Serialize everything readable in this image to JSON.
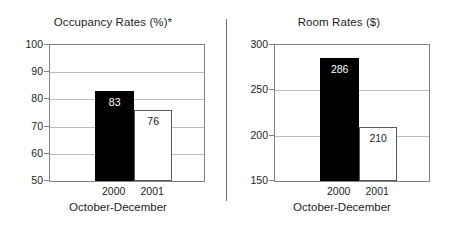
{
  "figure": {
    "divider": "vertical-rule",
    "panels": [
      "occupancy",
      "room_rates"
    ]
  },
  "chart_data": [
    {
      "type": "bar",
      "id": "occupancy",
      "title": "Occupancy Rates (%)*",
      "xlabel": "October-December",
      "ylabel": "",
      "categories": [
        "2000",
        "2001"
      ],
      "values": [
        83,
        76
      ],
      "value_labels": [
        "83",
        "76"
      ],
      "ylim": [
        50,
        100
      ],
      "yticks": [
        50,
        60,
        70,
        80,
        90,
        100
      ],
      "ytick_labels": [
        "50",
        "60",
        "70",
        "80",
        "90",
        "100"
      ],
      "grid": true,
      "legend": "none",
      "bar_styles": [
        "filled",
        "hollow"
      ],
      "colors": {
        "filled": "#000000",
        "hollow": "#ffffff",
        "outline": "#58595b",
        "grid": "#b9bbbd",
        "axis": "#808285",
        "text": "#231f20"
      }
    },
    {
      "type": "bar",
      "id": "room_rates",
      "title": "Room Rates ($)",
      "xlabel": "October-December",
      "ylabel": "",
      "categories": [
        "2000",
        "2001"
      ],
      "values": [
        286,
        210
      ],
      "value_labels": [
        "286",
        "210"
      ],
      "ylim": [
        150,
        300
      ],
      "yticks": [
        150,
        200,
        250,
        300
      ],
      "ytick_labels": [
        "150",
        "200",
        "250",
        "300"
      ],
      "grid": true,
      "legend": "none",
      "bar_styles": [
        "filled",
        "hollow"
      ],
      "colors": {
        "filled": "#000000",
        "hollow": "#ffffff",
        "outline": "#58595b",
        "grid": "#b9bbbd",
        "axis": "#808285",
        "text": "#231f20"
      }
    }
  ]
}
